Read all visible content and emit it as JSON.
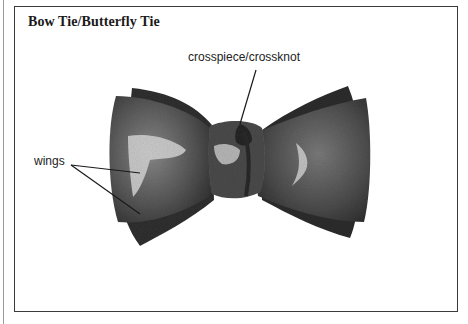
{
  "title": "Bow Tie/Butterfly Tie",
  "labels": {
    "crosspiece": "crosspiece/crossknot",
    "wings": "wings"
  },
  "colors": {
    "ink": "#1a1a1a",
    "fabric_dark": "#3c3c3c",
    "fabric_mid": "#6e6e6e",
    "highlight": "#d8d8d8",
    "frame": "#3a3a3a"
  }
}
